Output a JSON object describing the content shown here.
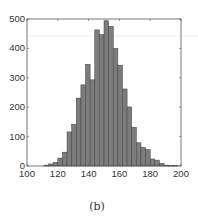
{
  "chart_data": {
    "type": "bar",
    "title": "",
    "caption": "(b)",
    "xlabel": "",
    "ylabel": "",
    "xlim": [
      100,
      200
    ],
    "ylim": [
      0,
      500
    ],
    "xticks": [
      100,
      120,
      140,
      160,
      180,
      200
    ],
    "yticks": [
      0,
      100,
      200,
      300,
      400,
      500
    ],
    "grid": false,
    "legend": null,
    "bin_start": 111,
    "bin_width": 3,
    "bin_centers": [
      112.5,
      115.5,
      118.5,
      121.5,
      124.5,
      127.5,
      130.5,
      133.5,
      136.5,
      139.5,
      142.5,
      145.5,
      148.5,
      151.5,
      154.5,
      157.5,
      160.5,
      163.5,
      166.5,
      169.5,
      172.5,
      175.5,
      178.5,
      181.5,
      184.5,
      187.5,
      190.5,
      193.5,
      196.5
    ],
    "values": [
      3,
      7,
      12,
      27,
      47,
      116,
      142,
      231,
      276,
      346,
      293,
      463,
      447,
      494,
      475,
      400,
      343,
      262,
      201,
      132,
      79,
      63,
      56,
      24,
      20,
      9,
      3,
      1,
      1
    ],
    "colors": {
      "bar_fill": "#7c7c7c",
      "bar_edge": "#3f3f3f",
      "axis": "#555555"
    }
  }
}
